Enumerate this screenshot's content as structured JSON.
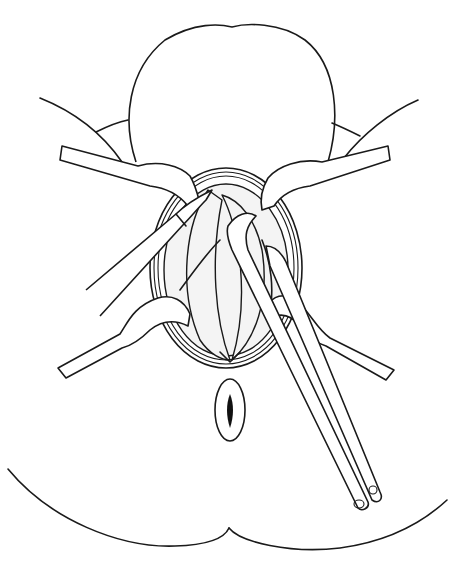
{
  "figure": {
    "type": "line-art surgical illustration",
    "background": "#ffffff",
    "stroke_color": "#1a1a1a",
    "elements": [
      "buttocks-outline",
      "thigh-outlines",
      "operative-field-incision",
      "retractors-four",
      "forceps",
      "anus"
    ]
  }
}
